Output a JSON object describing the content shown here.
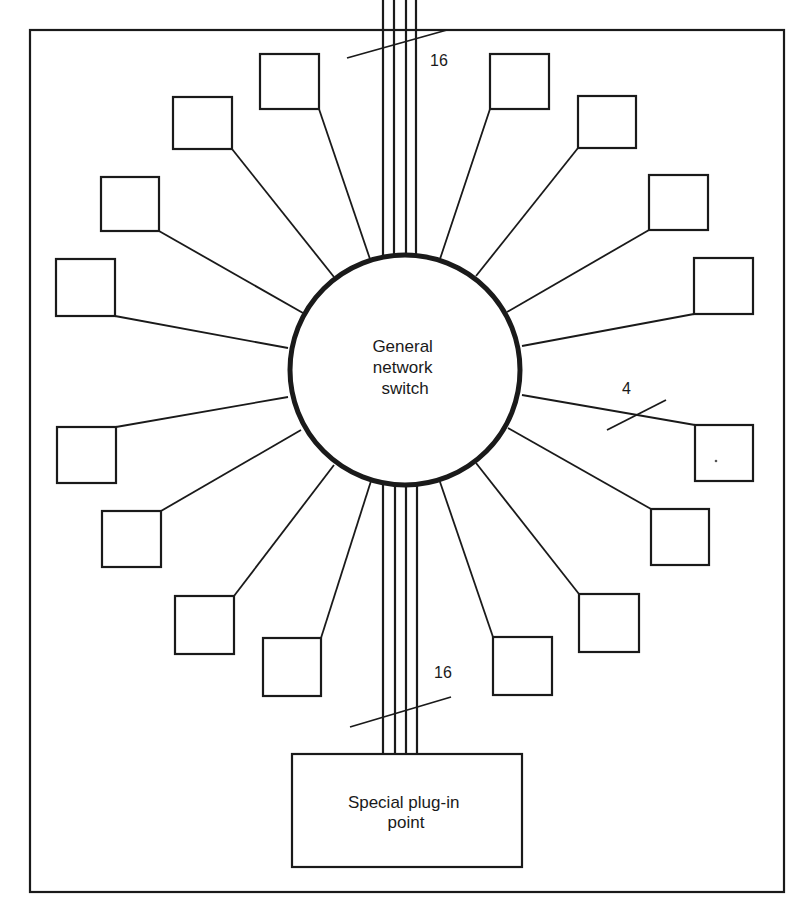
{
  "diagram": {
    "switch": {
      "label_lines": [
        "General",
        "network",
        "switch"
      ],
      "cx": 405,
      "cy": 370,
      "r": 115
    },
    "plug_in": {
      "label_lines": [
        "Special plug-in",
        "point"
      ],
      "x": 292,
      "y": 754,
      "w": 230,
      "h": 113
    },
    "border": {
      "x": 30,
      "y": 30,
      "w": 754,
      "h": 862
    },
    "bus_labels": {
      "top_count": "16",
      "bottom_count": "16",
      "link_count": "4"
    },
    "colors": {
      "ink": "#1a1a1a",
      "paper": "#ffffff"
    },
    "nodes": [
      {
        "id": "n1",
        "x": 260,
        "y": 54,
        "w": 59,
        "h": 55,
        "ax": 319,
        "ay": 109,
        "cx": 371,
        "cy": 262
      },
      {
        "id": "n2",
        "x": 173,
        "y": 97,
        "w": 59,
        "h": 52,
        "ax": 232,
        "ay": 149,
        "cx": 334,
        "cy": 277
      },
      {
        "id": "n3",
        "x": 101,
        "y": 177,
        "w": 58,
        "h": 54,
        "ax": 159,
        "ay": 231,
        "cx": 303,
        "cy": 313
      },
      {
        "id": "n4",
        "x": 56,
        "y": 259,
        "w": 59,
        "h": 57,
        "ax": 115,
        "ay": 316,
        "cx": 288,
        "cy": 348
      },
      {
        "id": "n5",
        "x": 57,
        "y": 427,
        "w": 59,
        "h": 56,
        "ax": 116,
        "ay": 427,
        "cx": 288,
        "cy": 397
      },
      {
        "id": "n6",
        "x": 102,
        "y": 511,
        "w": 59,
        "h": 56,
        "ax": 161,
        "ay": 511,
        "cx": 301,
        "cy": 430
      },
      {
        "id": "n7",
        "x": 175,
        "y": 596,
        "w": 59,
        "h": 58,
        "ax": 234,
        "ay": 596,
        "cx": 334,
        "cy": 465
      },
      {
        "id": "n8",
        "x": 263,
        "y": 638,
        "w": 58,
        "h": 58,
        "ax": 321,
        "ay": 638,
        "cx": 371,
        "cy": 481
      },
      {
        "id": "n9",
        "x": 490,
        "y": 54,
        "w": 59,
        "h": 55,
        "ax": 490,
        "ay": 109,
        "cx": 439,
        "cy": 262
      },
      {
        "id": "n10",
        "x": 578,
        "y": 96,
        "w": 58,
        "h": 52,
        "ax": 578,
        "ay": 148,
        "cx": 476,
        "cy": 276
      },
      {
        "id": "n11",
        "x": 649,
        "y": 175,
        "w": 59,
        "h": 55,
        "ax": 649,
        "ay": 230,
        "cx": 507,
        "cy": 312
      },
      {
        "id": "n12",
        "x": 694,
        "y": 258,
        "w": 59,
        "h": 56,
        "ax": 694,
        "ay": 314,
        "cx": 522,
        "cy": 346
      },
      {
        "id": "n13",
        "x": 695,
        "y": 425,
        "w": 58,
        "h": 56,
        "ax": 695,
        "ay": 425,
        "cx": 522,
        "cy": 395
      },
      {
        "id": "n14",
        "x": 651,
        "y": 509,
        "w": 58,
        "h": 56,
        "ax": 651,
        "ay": 509,
        "cx": 508,
        "cy": 428
      },
      {
        "id": "n15",
        "x": 579,
        "y": 594,
        "w": 60,
        "h": 58,
        "ax": 579,
        "ay": 594,
        "cx": 476,
        "cy": 463
      },
      {
        "id": "n16",
        "x": 493,
        "y": 637,
        "w": 59,
        "h": 58,
        "ax": 493,
        "ay": 637,
        "cx": 439,
        "cy": 479
      }
    ],
    "top_bus_x": [
      383,
      394,
      406,
      416
    ],
    "bottom_bus_x": [
      383,
      395,
      406,
      417
    ]
  }
}
